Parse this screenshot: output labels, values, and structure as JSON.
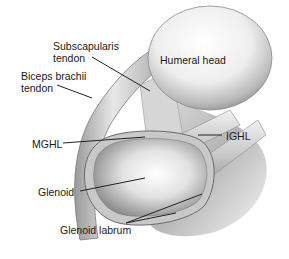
{
  "diagram": {
    "labels": {
      "subscapularis_line1": "Subscapularis",
      "subscapularis_line2": "tendon",
      "humeral_head": "Humeral head",
      "biceps_line1": "Biceps brachii",
      "biceps_line2": "tendon",
      "mghl": "MGHL",
      "ighl": "IGHL",
      "glenoid": "Glenoid",
      "glenoid_labrum": "Glenoid labrum"
    },
    "colors": {
      "background": "#ffffff",
      "text": "#1a1a1a",
      "leader_line": "#222222",
      "structure_light": "#e6e6e6",
      "structure_mid": "#b5b5b5",
      "structure_dark": "#6e6e6e"
    }
  }
}
